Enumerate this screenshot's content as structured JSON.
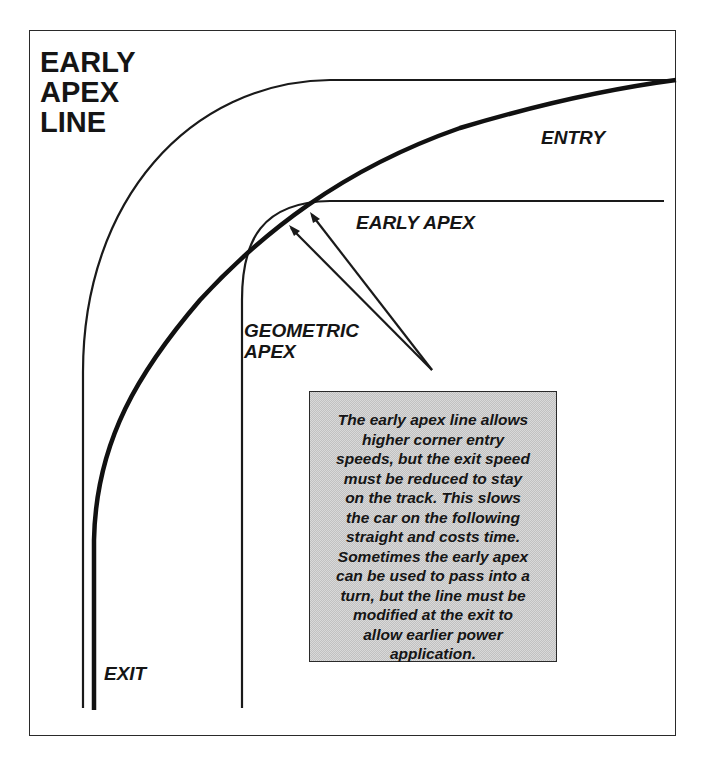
{
  "diagram": {
    "title_lines": [
      "EARLY",
      "APEX",
      "LINE"
    ],
    "labels": {
      "entry": "ENTRY",
      "early_apex": "EARLY APEX",
      "geometric_apex_lines": [
        "GEOMETRIC",
        "APEX"
      ],
      "exit": "EXIT"
    },
    "note": {
      "lines": [
        "The early apex line allows",
        "higher corner entry",
        "speeds, but the exit speed",
        "must be reduced to stay",
        "on the track.  This slows",
        "the car on the following",
        "straight and costs time.",
        "Sometimes the early apex",
        "can be used to pass into a",
        "turn, but the line must be",
        "modified at the exit to",
        "allow earlier power",
        "application."
      ]
    },
    "elements": [
      "outside-track-edge",
      "inside-track-edge",
      "racing-line",
      "geometric-apex-pointer",
      "early-apex-pointer"
    ],
    "colors": {
      "line": "#1a1a1a",
      "note_background": "#d9d9d9"
    }
  }
}
